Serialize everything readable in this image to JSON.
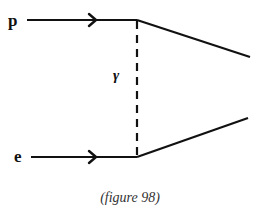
{
  "diagram": {
    "type": "feynman",
    "colors": {
      "line": "#111111",
      "caption": "#333333",
      "background": "#ffffff"
    },
    "incoming": [
      {
        "label": "p",
        "name": "proton"
      },
      {
        "label": "e",
        "name": "electron"
      }
    ],
    "propagator": {
      "label": "γ",
      "name": "photon",
      "style": "dashed"
    },
    "caption": "(figure 98)"
  }
}
